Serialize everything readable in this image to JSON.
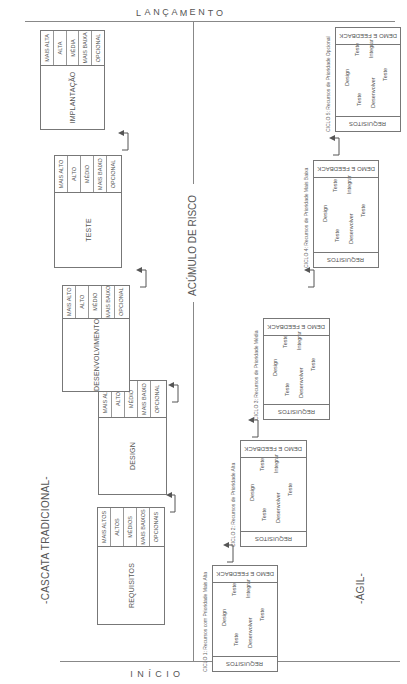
{
  "axis": {
    "start_label": "INÍCIO",
    "start_letters": [
      "I",
      "N",
      "Í",
      "C",
      "I",
      "O"
    ],
    "end_label": "LANÇAMENTO",
    "end_letters": [
      "L",
      "A",
      "N",
      "Ç",
      "A",
      "M",
      "E",
      "N",
      "T",
      "O"
    ],
    "divider_label": "ACÚMULO DE RISCO"
  },
  "waterfall": {
    "title": "-CASCATA TRADICIONAL-",
    "phases": [
      {
        "name": "REQUISITOS",
        "priorities": [
          "MAIS ALTOS",
          "ALTOS",
          "MÉDIOS",
          "MAIS BAIXOS",
          "OPCIONAIS"
        ]
      },
      {
        "name": "DESIGN",
        "priorities": [
          "MAIS ALTO",
          "ALTO",
          "MÉDIO",
          "MAIS BAIXO",
          "OPCIONAL"
        ]
      },
      {
        "name": "DESENVOLVIMENTO",
        "priorities": [
          "MAIS ALTO",
          "ALTO",
          "MÉDIO",
          "MAIS BAIXO",
          "OPCIONAL"
        ]
      },
      {
        "name": "TESTE",
        "priorities": [
          "MAIS ALTO",
          "ALTO",
          "MÉDIO",
          "MAIS BAIXO",
          "OPCIONAL"
        ]
      },
      {
        "name": "IMPLANTAÇÃO",
        "priorities": [
          "MAIS ALTA",
          "ALTA",
          "MÉDIA",
          "MAIS BAIXA",
          "OPCIONAL"
        ]
      }
    ]
  },
  "agile": {
    "title": "-ÁGIL-",
    "cycles": [
      {
        "label": "CICLO 1: Recursos com Prioridade Mais Alta",
        "header": "DEMO E FEEDBACK",
        "footer": "REQUISITOS",
        "steps": [
          "Design",
          "Teste",
          "Integrar",
          "Teste",
          "Desenvolver",
          "Teste"
        ]
      },
      {
        "label": "CICLO 2: Recursos de Prioridade Alta",
        "header": "DEMO E FEEDBACK",
        "footer": "REQUISITOS",
        "steps": [
          "Design",
          "Teste",
          "Integrar",
          "Teste",
          "Desenvolver",
          "Teste"
        ]
      },
      {
        "label": "CICLO 3: Recursos de Prioridade Média",
        "header": "DEMO E FEEDBACK",
        "footer": "REQUISITOS",
        "steps": [
          "Design",
          "Teste",
          "Integrar",
          "Teste",
          "Desenvolver",
          "Teste"
        ]
      },
      {
        "label": "CICLO 4: Recursos de Prioridade Mais Baixa",
        "header": "DEMO E FEEDBACK",
        "footer": "REQUISITOS",
        "steps": [
          "Design",
          "Teste",
          "Integrar",
          "Teste",
          "Desenvolver",
          "Teste"
        ]
      },
      {
        "label": "CICLO 5: Recursos de Prioridade Opcional",
        "header": "DEMO E FEEDBACK",
        "footer": "REQUISITOS",
        "steps": [
          "Design",
          "Teste",
          "Integrar",
          "Teste",
          "Desenvolver",
          "Teste"
        ]
      }
    ]
  }
}
